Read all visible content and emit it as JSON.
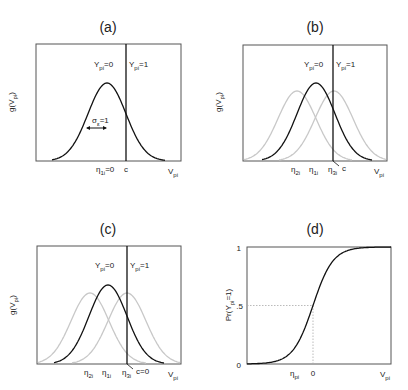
{
  "chart_data": [
    {
      "panel": "a",
      "type": "line",
      "title": "(a)",
      "xlabel": "V_pi",
      "ylabel": "g(V_pi)",
      "grid": false,
      "series": [
        {
          "name": "g(V_pi), eta_1i=0",
          "mean": 0,
          "sd": 1,
          "style": "black"
        }
      ],
      "annotations": [
        "Y_pi=0",
        "Y_pi=1",
        "sigma_e=1"
      ],
      "xticks": [
        "eta_1i=0",
        "c"
      ],
      "threshold_c": 0.55
    },
    {
      "panel": "b",
      "type": "line",
      "title": "(b)",
      "xlabel": "V_pi",
      "ylabel": "g(V_pi)",
      "grid": false,
      "series": [
        {
          "name": "eta_2i",
          "mean": -0.6,
          "sd": 1,
          "style": "gray"
        },
        {
          "name": "eta_1i",
          "mean": 0,
          "sd": 1,
          "style": "black"
        },
        {
          "name": "eta_3i",
          "mean": 0.6,
          "sd": 1,
          "style": "gray"
        }
      ],
      "annotations": [
        "Y_pi=0",
        "Y_pi=1"
      ],
      "xticks": [
        "eta_2i",
        "eta_1i",
        "eta_3i",
        "c"
      ],
      "threshold_c": 0.6
    },
    {
      "panel": "c",
      "type": "line",
      "title": "(c)",
      "xlabel": "V_pi",
      "ylabel": "g(V_pi)",
      "grid": false,
      "series": [
        {
          "name": "eta_2i",
          "mean": -0.6,
          "sd": 1,
          "style": "gray"
        },
        {
          "name": "eta_1i",
          "mean": 0,
          "sd": 1,
          "style": "black"
        },
        {
          "name": "eta_3i",
          "mean": 0.6,
          "sd": 1,
          "style": "gray"
        }
      ],
      "annotations": [
        "Y_pi=0",
        "Y_pi=1"
      ],
      "xticks": [
        "eta_2i",
        "eta_1i",
        "eta_3i",
        "c=0"
      ],
      "threshold_c": 0.6
    },
    {
      "panel": "d",
      "type": "line",
      "title": "(d)",
      "xlabel": "V_pi",
      "ylabel": "Pr(Y_pi=1)",
      "grid": false,
      "yticks": [
        "0",
        ".5",
        "1"
      ],
      "ylim": [
        0,
        1
      ],
      "xticks": [
        "eta_pi",
        "0"
      ],
      "series": [
        {
          "name": "Pr(Y_pi=1)",
          "type": "cumulative normal",
          "x_at_half": 0
        }
      ],
      "reference_lines": [
        {
          "y": 0.5,
          "style": "dotted"
        },
        {
          "x": 0,
          "style": "dotted"
        }
      ]
    }
  ],
  "panels": {
    "a": {
      "title": "(a)",
      "ylabel": "g(V",
      "ylabel_sub": "pi",
      "ylabel_end": ")",
      "y0": "Y",
      "y0_sub": "pi",
      "y0_end": "=0",
      "y1": "Y",
      "y1_sub": "pi",
      "y1_end": "=1",
      "sigma": "σ",
      "sigma_sub": "ε",
      "sigma_end": "=1",
      "eta": "η",
      "eta_sub": "1i",
      "eta_end": "=0",
      "c": "c",
      "xlabel": "V",
      "xlabel_sub": "pi"
    },
    "b": {
      "title": "(b)",
      "ylabel": "g(V",
      "ylabel_sub": "pi",
      "ylabel_end": ")",
      "y0": "Y",
      "y0_sub": "pi",
      "y0_end": "=0",
      "y1": "Y",
      "y1_sub": "pi",
      "y1_end": "=1",
      "eta2": "η",
      "eta2_sub": "2i",
      "eta1": "η",
      "eta1_sub": "1i",
      "eta3": "η",
      "eta3_sub": "3i",
      "c": "c",
      "xlabel": "V",
      "xlabel_sub": "pi"
    },
    "c": {
      "title": "(c)",
      "ylabel": "g(V",
      "ylabel_sub": "pi",
      "ylabel_end": ")",
      "y0": "Y",
      "y0_sub": "pi",
      "y0_end": "=0",
      "y1": "Y",
      "y1_sub": "pi",
      "y1_end": "=1",
      "eta2": "η",
      "eta2_sub": "2i",
      "eta1": "η",
      "eta1_sub": "1i",
      "eta3": "η",
      "eta3_sub": "3i",
      "c": "c=0",
      "xlabel": "V",
      "xlabel_sub": "pi"
    },
    "d": {
      "title": "(d)",
      "ylabel": "Pr(Y",
      "ylabel_sub": "pi",
      "ylabel_end": "=1)",
      "tick0": "0",
      "tick5": ".5",
      "tick1": "1",
      "eta": "η",
      "eta_sub": "pi",
      "zero": "0",
      "xlabel": "V",
      "xlabel_sub": "pi"
    }
  },
  "colors": {
    "axis": "#555555",
    "curve": "#111111",
    "gray_curve": "#c8c8c8",
    "dotted": "#aaaaaa"
  }
}
